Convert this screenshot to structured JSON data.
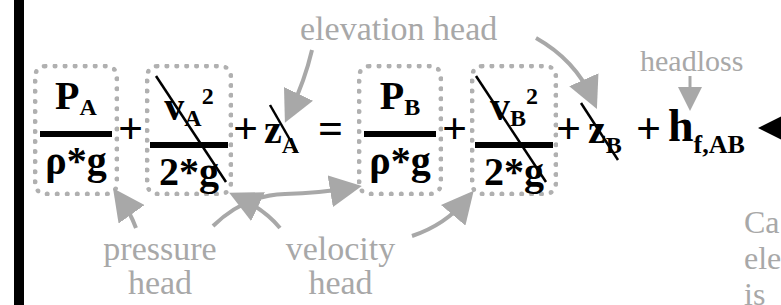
{
  "equation": {
    "lhs": {
      "pressure_term": {
        "numerator": "P",
        "numerator_sub": "A",
        "denominator": "ρ*g"
      },
      "velocity_term": {
        "numerator": "v",
        "numerator_sub": "A",
        "numerator_sup": "2",
        "denominator": "2*g",
        "crossed_out": true
      },
      "elevation_term": {
        "symbol": "z",
        "sub": "A",
        "crossed_out": true
      }
    },
    "equals": "=",
    "plus": "+",
    "rhs": {
      "pressure_term": {
        "numerator": "P",
        "numerator_sub": "B",
        "denominator": "ρ*g"
      },
      "velocity_term": {
        "numerator": "v",
        "numerator_sub": "B",
        "numerator_sup": "2",
        "denominator": "2*g",
        "crossed_out": true
      },
      "elevation_term": {
        "symbol": "z",
        "sub": "B",
        "crossed_out": true
      },
      "headloss_term": {
        "symbol": "h",
        "sub": "f,AB"
      }
    }
  },
  "annotations": {
    "elevation_head": "elevation head",
    "headloss": "headloss",
    "pressure_head_line1": "pressure",
    "pressure_head_line2": "head",
    "velocity_head_line1": "velocity",
    "velocity_head_line2": "head",
    "side_note_lines": [
      "Ca",
      "ele",
      "is"
    ]
  },
  "colors": {
    "equation": "#000000",
    "annotation": "#a8a8a8",
    "dotted_box": "#b0b0b0",
    "left_bar": "#000000"
  }
}
